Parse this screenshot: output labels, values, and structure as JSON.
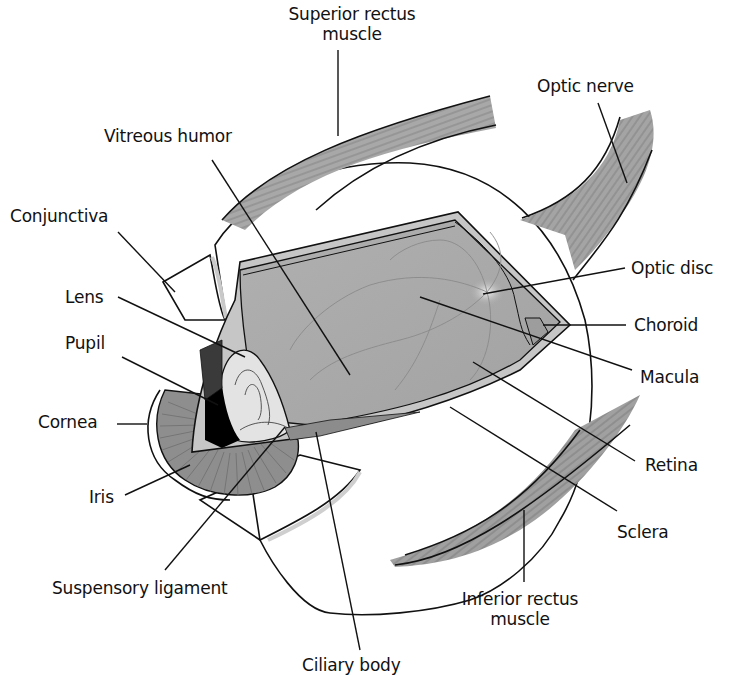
{
  "diagram": {
    "colors": {
      "background": "#ffffff",
      "outline": "#111111",
      "interior_gray": "#a9a9a9",
      "muscle_gray": "#9a9a9a",
      "sclera_band": "#c6c6c6",
      "iris_gray": "#8e8e8e",
      "pupil": "#000000",
      "optic_disc_highlight": "#f2f2f2"
    },
    "labels": [
      {
        "id": "superior-rectus",
        "text_lines": [
          "Superior rectus",
          "muscle"
        ],
        "x": 287,
        "y": 4,
        "w": 130,
        "align": "center",
        "leader": [
          [
            338,
            50
          ],
          [
            338,
            136
          ]
        ]
      },
      {
        "id": "optic-nerve",
        "text_lines": [
          "Optic nerve"
        ],
        "x": 537,
        "y": 76,
        "w": 110,
        "align": "left",
        "leader": [
          [
            598,
            103
          ],
          [
            627,
            183
          ]
        ]
      },
      {
        "id": "vitreous-humor",
        "text_lines": [
          "Vitreous humor"
        ],
        "x": 104,
        "y": 126,
        "w": 140,
        "align": "left",
        "leader": [
          [
            212,
            160
          ],
          [
            350,
            375
          ]
        ]
      },
      {
        "id": "conjunctiva",
        "text_lines": [
          "Conjunctiva"
        ],
        "x": 10,
        "y": 206,
        "w": 120,
        "align": "left",
        "leader": [
          [
            118,
            232
          ],
          [
            175,
            292
          ]
        ]
      },
      {
        "id": "optic-disc",
        "text_lines": [
          "Optic disc"
        ],
        "x": 631,
        "y": 260,
        "w": 110,
        "align": "left",
        "leader": [
          [
            625,
            268
          ],
          [
            483,
            294
          ]
        ]
      },
      {
        "id": "lens",
        "text_lines": [
          "Lens"
        ],
        "x": 65,
        "y": 288,
        "w": 50,
        "align": "left",
        "leader": [
          [
            118,
            297
          ],
          [
            245,
            357
          ]
        ]
      },
      {
        "id": "choroid",
        "text_lines": [
          "Choroid"
        ],
        "x": 634,
        "y": 315,
        "w": 90,
        "align": "left",
        "leader": [
          [
            626,
            325
          ],
          [
            543,
            325
          ]
        ]
      },
      {
        "id": "pupil",
        "text_lines": [
          "Pupil"
        ],
        "x": 65,
        "y": 333,
        "w": 50,
        "align": "left",
        "leader": [
          [
            122,
            357
          ],
          [
            218,
            405
          ]
        ]
      },
      {
        "id": "macula",
        "text_lines": [
          "Macula"
        ],
        "x": 640,
        "y": 367,
        "w": 80,
        "align": "left",
        "leader": [
          [
            632,
            370
          ],
          [
            420,
            297
          ]
        ]
      },
      {
        "id": "cornea",
        "text_lines": [
          "Cornea"
        ],
        "x": 38,
        "y": 411,
        "w": 80,
        "align": "left",
        "leader": [
          [
            117,
            424
          ],
          [
            147,
            424
          ]
        ]
      },
      {
        "id": "retina",
        "text_lines": [
          "Retina"
        ],
        "x": 645,
        "y": 454,
        "w": 80,
        "align": "left",
        "leader": [
          [
            635,
            461
          ],
          [
            473,
            362
          ]
        ]
      },
      {
        "id": "iris",
        "text_lines": [
          "Iris"
        ],
        "x": 89,
        "y": 487,
        "w": 40,
        "align": "left",
        "leader": [
          [
            125,
            495
          ],
          [
            190,
            465
          ]
        ]
      },
      {
        "id": "sclera",
        "text_lines": [
          "Sclera"
        ],
        "x": 617,
        "y": 522,
        "w": 80,
        "align": "left",
        "leader": [
          [
            617,
            511
          ],
          [
            450,
            407
          ]
        ]
      },
      {
        "id": "suspensory-ligament",
        "text_lines": [
          "Suspensory ligament"
        ],
        "x": 52,
        "y": 578,
        "w": 210,
        "align": "left",
        "leader": [
          [
            165,
            570
          ],
          [
            285,
            427
          ]
        ]
      },
      {
        "id": "inferior-rectus",
        "text_lines": [
          "Inferior rectus",
          "muscle"
        ],
        "x": 450,
        "y": 589,
        "w": 140,
        "align": "center",
        "leader": [
          [
            524,
            582
          ],
          [
            524,
            510
          ]
        ]
      },
      {
        "id": "ciliary-body",
        "text_lines": [
          "Ciliary body"
        ],
        "x": 302,
        "y": 655,
        "w": 130,
        "align": "left",
        "leader": [
          [
            360,
            650
          ],
          [
            316,
            432
          ]
        ]
      }
    ]
  }
}
